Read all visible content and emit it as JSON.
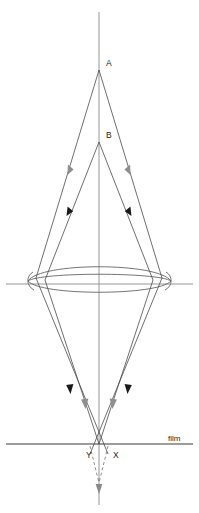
{
  "figure": {
    "type": "optical-ray-diagram",
    "title": "",
    "background_color": "#ffffff",
    "width": 199,
    "height": 513
  },
  "colors": {
    "ray": "#4a4a4a",
    "virtual_ray": "#6e6e6e",
    "axis": "#8a8a8a",
    "film": "#3a3a3a",
    "lens": "#5c5c5c",
    "arrow_dark": "#1a1a1a",
    "arrow_gray": "#8e8e8e",
    "label_text": "#1c1c1c"
  },
  "labels": {
    "point_a": "A",
    "point_b": "B",
    "image_x": "X",
    "image_y": "Y",
    "film": "film"
  },
  "points": {
    "a": {
      "label": "A",
      "x": 99,
      "y": 70,
      "label_x": 106,
      "label_y": 66
    },
    "b": {
      "label": "B",
      "x": 99,
      "y": 142,
      "label_x": 106,
      "label_y": 138
    },
    "x": {
      "label": "X",
      "x": 108,
      "y": 444,
      "label_x": 114,
      "label_y": 457
    },
    "y": {
      "label": "Y",
      "x": 90,
      "y": 444,
      "label_x": 88,
      "label_y": 457
    },
    "convergence": {
      "x": 99,
      "y": 483
    }
  },
  "elements": {
    "optical_axis": {
      "name": "optical-axis",
      "x": 99,
      "y_top": 12,
      "y_bottom": 505
    },
    "lens": {
      "name": "converging-lens",
      "center_x": 99,
      "center_y": 275,
      "half_width": 72,
      "half_height": 13
    },
    "lens_axis": {
      "name": "lens-horizontal-axis",
      "y": 284,
      "x_left": 6,
      "x_right": 193
    },
    "film_plane": {
      "name": "film-plane",
      "y": 444,
      "x_left": 6,
      "x_right": 193
    }
  },
  "rays": {
    "from_a": {
      "source": "A",
      "arrow_color": "#8e8e8e",
      "description": "Outer ray pair diverging from point A, refracted by lens, converging below film plane"
    },
    "from_b": {
      "source": "B",
      "arrow_color": "#1a1a1a",
      "description": "Inner ray pair diverging from point B, refracted by lens, converging at film plane"
    },
    "virtual": {
      "style": "dashed",
      "description": "Dashed continuation of A rays beyond the film plane to their true focus"
    }
  }
}
